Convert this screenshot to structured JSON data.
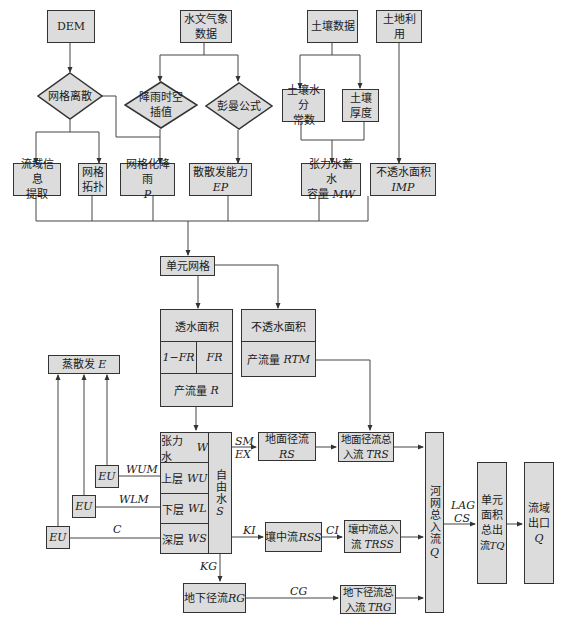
{
  "inputs": {
    "dem": "DEM",
    "hydro_meteo": [
      "水文气象",
      "数据"
    ],
    "soil_data": "土壤数据",
    "land_use": "土地利用"
  },
  "decisions": {
    "grid_discretize": "网格离散",
    "rain_interp": [
      "降雨时空",
      "插值"
    ],
    "penman": "彭曼公式"
  },
  "soil_params": {
    "soil_water_const": [
      "土壤水分",
      "常数"
    ],
    "soil_thickness": [
      "土壤",
      "厚度"
    ]
  },
  "derived": {
    "watershed_info": [
      "流域信息",
      "提取"
    ],
    "grid_topology": [
      "网格",
      "拓扑"
    ],
    "grid_rain": {
      "label": "网格化降雨",
      "sym": "P"
    },
    "evap_capacity": {
      "label": "散散发能力",
      "sym": "EP"
    },
    "tension_capacity": {
      "label1": "张力水蓄水",
      "label2": "容量",
      "sym": "MW"
    },
    "impervious": {
      "label": "不透水面积",
      "sym": "IMP"
    }
  },
  "unit_grid": "单元网格",
  "pervious": {
    "title": "透水面积",
    "left": "1−FR",
    "right": "FR",
    "runoff": "产流量",
    "runoff_sym": "R"
  },
  "impervious_area": {
    "title": "不透水面积",
    "runoff": "产流量",
    "runoff_sym": "RTM"
  },
  "evap": {
    "label": "蒸散发",
    "sym": "E"
  },
  "soil_layers": {
    "tension": {
      "label": "张力水",
      "sym": "W"
    },
    "upper": {
      "label": "上层",
      "sym": "WU"
    },
    "lower": {
      "label": "下层",
      "sym": "WL"
    },
    "deep": {
      "label": "深层",
      "sym": "WS"
    },
    "free_water": "自由水",
    "free_sym": "S"
  },
  "eu_boxes": [
    "EU",
    "EU",
    "EU"
  ],
  "edge_labels": {
    "wum": "WUM",
    "wlm": "WLM",
    "c": "C",
    "sm": "SM",
    "ex": "EX",
    "ki": "KI",
    "ci": "CI",
    "kg": "KG",
    "cg": "CG",
    "lag": "LAG",
    "cs": "CS"
  },
  "runoff": {
    "surface": {
      "label": "地面径流",
      "sym": "RS"
    },
    "surface_total": {
      "label1": "地面径流总",
      "label2": "入流",
      "sym": "TRS"
    },
    "interflow": {
      "label": "壤中流",
      "sym": "RSS"
    },
    "interflow_total": {
      "label1": "壤中流总入",
      "label2": "流",
      "sym": "TRSS"
    },
    "ground": {
      "label": "地下径流",
      "sym": "RG"
    },
    "ground_total": {
      "label1": "地下径流总",
      "label2": "入流",
      "sym": "TRG"
    }
  },
  "river_inflow": {
    "label": "河网总入流",
    "sym": "Q"
  },
  "unit_outflow": {
    "label": [
      "单元",
      "面积",
      "总出",
      "流"
    ],
    "sym": "TQ"
  },
  "outlet": {
    "label": [
      "流域",
      "出口"
    ],
    "sym": "Q"
  },
  "colors": {
    "box_fill": "#dcdcdc",
    "line": "#333333",
    "background": "#ffffff"
  }
}
